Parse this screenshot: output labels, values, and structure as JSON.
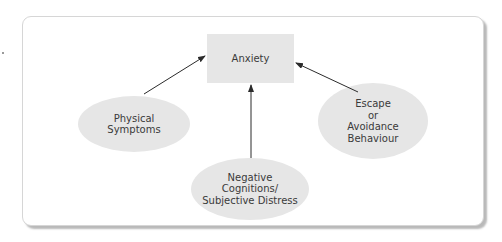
{
  "diagram": {
    "type": "concept-map",
    "colors": {
      "node_fill": "#e6e6e6",
      "arrow": "#2b2b2b",
      "text": "#3a3a3a",
      "frame_border": "#d6d6d6"
    },
    "center_node": {
      "label": "Anxiety",
      "shape": "rectangle"
    },
    "nodes": [
      {
        "id": "physical",
        "label": "Physical\nSymptoms",
        "shape": "ellipse"
      },
      {
        "id": "escape",
        "label": "Escape\nor\nAvoidance\nBehaviour",
        "shape": "ellipse"
      },
      {
        "id": "cognitions",
        "label": "Negative\nCognitions/\nSubjective Distress",
        "shape": "ellipse"
      }
    ],
    "edges": [
      {
        "from": "physical",
        "to": "anxiety"
      },
      {
        "from": "escape",
        "to": "anxiety"
      },
      {
        "from": "cognitions",
        "to": "anxiety"
      }
    ]
  }
}
